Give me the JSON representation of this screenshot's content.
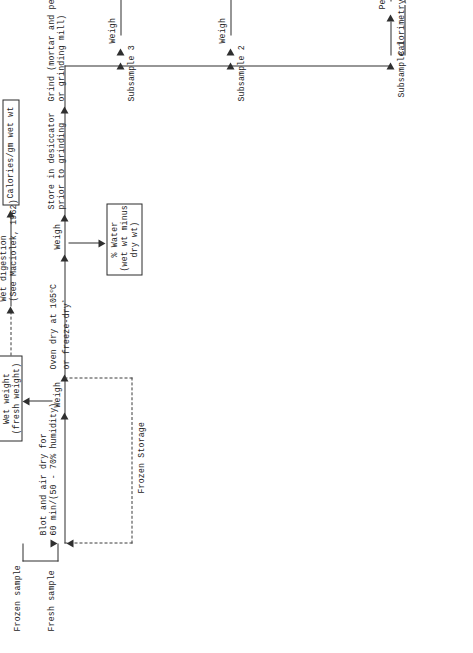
{
  "diagram": {
    "orientation": "rotated-90-ccw",
    "sources": {
      "fresh_sample": "Fresh sample",
      "frozen_sample": "Frozen sample"
    },
    "storage_box": "Frozen Storage",
    "steps": {
      "blot_air_dry": "Blot and air dry for\n60 min/(50 - 70% humidity)",
      "weigh_1": "Weigh",
      "oven_dry": "Oven dry at 105°C\nor freeze-dry*",
      "weigh_2": "Weigh",
      "store_desiccator": "Store in desiccator\nprior to grinding",
      "grind": "Grind (mortar and pestle\nor grinding mill)",
      "wet_digestion": "Wet digestion\n(See Maciolek, 1962)",
      "pellet_formation": "Pellet formation",
      "weigh_cal_pan": "Weigh calorimeter pan",
      "weigh_pan_pellet": "Weigh pan plus pellet",
      "flush_bomb": "Flush bomb with oxygen\nto reduce acid formation\ncorrection",
      "combust": "Combust in adiabatic\nor Phillipson-type\ncalorimeter",
      "correct_acid": "Correct for acid\n(NHO3, H2SO4) formation **",
      "fuse_wire": "Fuse wire correction **",
      "ss2_weigh_a": "Weigh",
      "ss2_acidity": "Acidity with HCl",
      "ss2_weigh_b": "Weigh",
      "ss2_carbonate_wt": "Carbonate weight\nby difference",
      "ss3_weigh_a": "Weigh",
      "ss3_ash": "Ash at 550°C",
      "ss3_weigh_b": "Weigh",
      "ss3_ash_wt": "Ash weight"
    },
    "branch_labels": {
      "subsample_1": "Subsample 1",
      "subsample_2": "Subsample 2",
      "subsample_3": "Subsample 3",
      "calorimetry": "Calorimetry"
    },
    "result_boxes": {
      "wet_weight": "Wet weight\n(fresh weight)",
      "calories_gm_wet_wt": "Calories/gm wet wt",
      "pct_water": "% Water\n(wet wt minus\ndry wt)",
      "sample_weight": "Sample weight\nby difference\n(dry weight)",
      "calories_gm_dry_wt": "Calories/gm dry wt",
      "pct_carbonate": "% Carbonate",
      "calories_carbonate_corrected": "Calories/gm **\ncarbonate\ncorrected dry wt",
      "pct_ash": "% Ash",
      "calories_ash_free_gm_dry_wt": "Calories/ash-free\ngm dry wt",
      "calories_ash_free_carbonate_corrected": "Calories/ash-free **\ngm carbonate\ncorrected dry wt"
    }
  }
}
